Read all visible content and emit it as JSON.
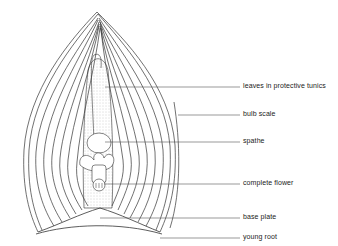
{
  "diagram": {
    "labels": [
      {
        "id": "leaves",
        "text": "leaves in protective tunics",
        "y": 87
      },
      {
        "id": "bulb-scale",
        "text": "bulb scale",
        "y": 115
      },
      {
        "id": "spathe",
        "text": "spathe",
        "y": 142
      },
      {
        "id": "complete-flower",
        "text": "complete flower",
        "y": 184
      },
      {
        "id": "base-plate",
        "text": "base plate",
        "y": 218
      },
      {
        "id": "young-root",
        "text": "young root",
        "y": 238
      }
    ],
    "colors": {
      "line": "#333333",
      "stipple": "#bbbbbb",
      "background": "#ffffff"
    }
  }
}
